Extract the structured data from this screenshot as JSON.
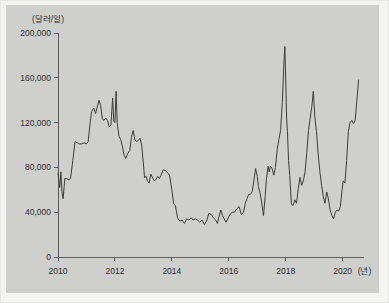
{
  "chart_data": {
    "type": "line",
    "title": "",
    "subtitle": "",
    "ylabel": "(달러/일)",
    "xlabel": "(년)",
    "xlabel_last_tick": "2020",
    "grid": false,
    "legend": null,
    "ylim": [
      0,
      200000
    ],
    "xlim": [
      2010,
      2020.75
    ],
    "y_ticks": [
      0,
      40000,
      80000,
      120000,
      160000,
      200000
    ],
    "y_tick_labels": [
      "0",
      "40,000",
      "80,000",
      "120,000",
      "160,000",
      "200,000"
    ],
    "x_ticks": [
      2010,
      2012,
      2014,
      2016,
      2018,
      2020
    ],
    "x_tick_labels": [
      "2010",
      "2012",
      "2014",
      "2016",
      "2018",
      "2020"
    ],
    "series": [
      {
        "name": "일일 용선료",
        "color": "#3c3c3a",
        "points": [
          [
            2010.0,
            75000
          ],
          [
            2010.06,
            62000
          ],
          [
            2010.1,
            76000
          ],
          [
            2010.14,
            58000
          ],
          [
            2010.18,
            52000
          ],
          [
            2010.24,
            70000
          ],
          [
            2010.3,
            70000
          ],
          [
            2010.36,
            69000
          ],
          [
            2010.44,
            70000
          ],
          [
            2010.52,
            86000
          ],
          [
            2010.6,
            103000
          ],
          [
            2010.68,
            102000
          ],
          [
            2010.76,
            101000
          ],
          [
            2010.84,
            101000
          ],
          [
            2010.92,
            102000
          ],
          [
            2011.0,
            101000
          ],
          [
            2011.06,
            103000
          ],
          [
            2011.12,
            118000
          ],
          [
            2011.18,
            130000
          ],
          [
            2011.26,
            133000
          ],
          [
            2011.32,
            128000
          ],
          [
            2011.38,
            134000
          ],
          [
            2011.44,
            140000
          ],
          [
            2011.5,
            135000
          ],
          [
            2011.56,
            123000
          ],
          [
            2011.62,
            122000
          ],
          [
            2011.68,
            124000
          ],
          [
            2011.74,
            122000
          ],
          [
            2011.8,
            116000
          ],
          [
            2011.86,
            118000
          ],
          [
            2011.92,
            142000
          ],
          [
            2011.96,
            121000
          ],
          [
            2012.0,
            120000
          ],
          [
            2012.04,
            148000
          ],
          [
            2012.08,
            120000
          ],
          [
            2012.14,
            108000
          ],
          [
            2012.2,
            105000
          ],
          [
            2012.26,
            99000
          ],
          [
            2012.32,
            91000
          ],
          [
            2012.38,
            88000
          ],
          [
            2012.44,
            92000
          ],
          [
            2012.52,
            95000
          ],
          [
            2012.58,
            107000
          ],
          [
            2012.64,
            113000
          ],
          [
            2012.7,
            105000
          ],
          [
            2012.76,
            103000
          ],
          [
            2012.82,
            104000
          ],
          [
            2012.88,
            106000
          ],
          [
            2012.94,
            100000
          ],
          [
            2013.0,
            83000
          ],
          [
            2013.04,
            71000
          ],
          [
            2013.1,
            72000
          ],
          [
            2013.14,
            68000
          ],
          [
            2013.2,
            66000
          ],
          [
            2013.26,
            74000
          ],
          [
            2013.32,
            71000
          ],
          [
            2013.38,
            68000
          ],
          [
            2013.44,
            69000
          ],
          [
            2013.5,
            72000
          ],
          [
            2013.56,
            70000
          ],
          [
            2013.62,
            73000
          ],
          [
            2013.7,
            78000
          ],
          [
            2013.78,
            77000
          ],
          [
            2013.86,
            75000
          ],
          [
            2013.92,
            73000
          ],
          [
            2014.0,
            60000
          ],
          [
            2014.06,
            48000
          ],
          [
            2014.12,
            46000
          ],
          [
            2014.2,
            35000
          ],
          [
            2014.28,
            32000
          ],
          [
            2014.36,
            33000
          ],
          [
            2014.44,
            30000
          ],
          [
            2014.52,
            34000
          ],
          [
            2014.6,
            33000
          ],
          [
            2014.68,
            35000
          ],
          [
            2014.74,
            33000
          ],
          [
            2014.82,
            34000
          ],
          [
            2014.9,
            33000
          ],
          [
            2014.98,
            31000
          ],
          [
            2015.06,
            33000
          ],
          [
            2015.14,
            29000
          ],
          [
            2015.22,
            32000
          ],
          [
            2015.3,
            39000
          ],
          [
            2015.38,
            38000
          ],
          [
            2015.46,
            35000
          ],
          [
            2015.54,
            33000
          ],
          [
            2015.6,
            30000
          ],
          [
            2015.66,
            36000
          ],
          [
            2015.72,
            42000
          ],
          [
            2015.78,
            37000
          ],
          [
            2015.84,
            34000
          ],
          [
            2015.9,
            31000
          ],
          [
            2015.96,
            34000
          ],
          [
            2016.04,
            38000
          ],
          [
            2016.12,
            40000
          ],
          [
            2016.2,
            40000
          ],
          [
            2016.28,
            43000
          ],
          [
            2016.36,
            45000
          ],
          [
            2016.44,
            38000
          ],
          [
            2016.52,
            40000
          ],
          [
            2016.58,
            48000
          ],
          [
            2016.64,
            52000
          ],
          [
            2016.7,
            56000
          ],
          [
            2016.76,
            56000
          ],
          [
            2016.82,
            58000
          ],
          [
            2016.88,
            68000
          ],
          [
            2016.94,
            79000
          ],
          [
            2017.0,
            72000
          ],
          [
            2017.04,
            63000
          ],
          [
            2017.1,
            57000
          ],
          [
            2017.16,
            48000
          ],
          [
            2017.22,
            37000
          ],
          [
            2017.28,
            55000
          ],
          [
            2017.32,
            69000
          ],
          [
            2017.38,
            81000
          ],
          [
            2017.42,
            76000
          ],
          [
            2017.46,
            81000
          ],
          [
            2017.52,
            79000
          ],
          [
            2017.58,
            73000
          ],
          [
            2017.64,
            80000
          ],
          [
            2017.7,
            96000
          ],
          [
            2017.76,
            105000
          ],
          [
            2017.82,
            113000
          ],
          [
            2017.88,
            138000
          ],
          [
            2017.94,
            175000
          ],
          [
            2017.97,
            188000
          ],
          [
            2018.0,
            158000
          ],
          [
            2018.03,
            125000
          ],
          [
            2018.06,
            112000
          ],
          [
            2018.1,
            86000
          ],
          [
            2018.14,
            73000
          ],
          [
            2018.2,
            47000
          ],
          [
            2018.26,
            46000
          ],
          [
            2018.32,
            51000
          ],
          [
            2018.38,
            48000
          ],
          [
            2018.44,
            61000
          ],
          [
            2018.5,
            71000
          ],
          [
            2018.56,
            64000
          ],
          [
            2018.62,
            68000
          ],
          [
            2018.68,
            76000
          ],
          [
            2018.74,
            93000
          ],
          [
            2018.8,
            113000
          ],
          [
            2018.86,
            124000
          ],
          [
            2018.92,
            135000
          ],
          [
            2018.97,
            148000
          ],
          [
            2019.02,
            126000
          ],
          [
            2019.08,
            112000
          ],
          [
            2019.14,
            92000
          ],
          [
            2019.2,
            76000
          ],
          [
            2019.26,
            64000
          ],
          [
            2019.32,
            54000
          ],
          [
            2019.38,
            48000
          ],
          [
            2019.44,
            58000
          ],
          [
            2019.5,
            52000
          ],
          [
            2019.56,
            42000
          ],
          [
            2019.62,
            37000
          ],
          [
            2019.68,
            34000
          ],
          [
            2019.74,
            40000
          ],
          [
            2019.8,
            42000
          ],
          [
            2019.86,
            41000
          ],
          [
            2019.92,
            45000
          ],
          [
            2019.97,
            58000
          ],
          [
            2020.02,
            68000
          ],
          [
            2020.08,
            66000
          ],
          [
            2020.14,
            86000
          ],
          [
            2020.2,
            112000
          ],
          [
            2020.26,
            120000
          ],
          [
            2020.32,
            122000
          ],
          [
            2020.38,
            119000
          ],
          [
            2020.44,
            122000
          ],
          [
            2020.5,
            140000
          ],
          [
            2020.56,
            158000
          ]
        ]
      }
    ]
  }
}
